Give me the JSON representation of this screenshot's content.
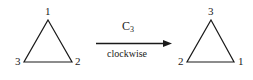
{
  "figure": {
    "background_color": "#ffffff",
    "stroke_color": "#1a1a1a",
    "left_triangle": {
      "name": "starting-triangle",
      "vertices": {
        "top": "1",
        "bottom_left": "3",
        "bottom_right": "2"
      }
    },
    "right_triangle": {
      "name": "rotated-triangle",
      "vertices": {
        "top": "3",
        "bottom_left": "2",
        "bottom_right": "1"
      }
    },
    "operation": {
      "symbol": "C",
      "subscript": "3",
      "direction": "clockwise",
      "arrow": "rightwards-arrow"
    }
  }
}
